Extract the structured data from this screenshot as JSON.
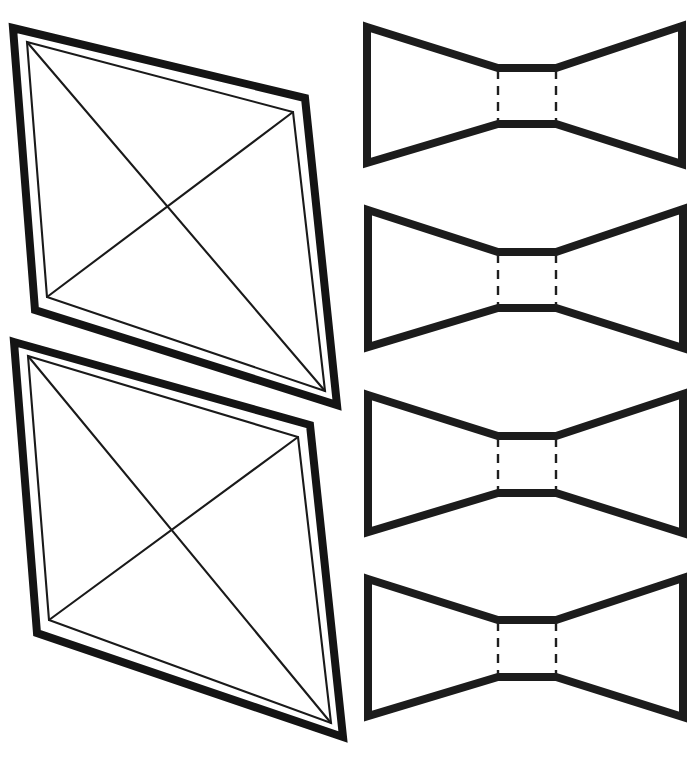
{
  "page": {
    "background_color": "#ffffff",
    "ink_color": "#141414",
    "width": 700,
    "height": 757
  },
  "style": {
    "thick_stroke_width": 8,
    "thin_stroke_width": 2.1,
    "dash_stroke_width": 2.4,
    "dash_pattern": "9 7"
  },
  "shapes": {
    "kites": [
      {
        "name": "kite-upper",
        "outer_points": "13,28 305,98 337,405 35,310",
        "inner_points": "27,42 293,112 325,391 47,297",
        "diagonals": [
          {
            "name": "diagonal-top-left-to-bottom-right",
            "x1": 27,
            "y1": 42,
            "x2": 325,
            "y2": 391
          },
          {
            "name": "diagonal-top-right-to-bottom-left",
            "x1": 293,
            "y1": 112,
            "x2": 47,
            "y2": 297
          }
        ]
      },
      {
        "name": "kite-lower",
        "outer_points": "14,342 310,425 343,737 37,633",
        "inner_points": "28,356 298,437 331,723 49,620",
        "diagonals": [
          {
            "name": "diagonal-top-left-to-bottom-right",
            "x1": 28,
            "y1": 356,
            "x2": 331,
            "y2": 723
          },
          {
            "name": "diagonal-top-right-to-bottom-left",
            "x1": 298,
            "y1": 437,
            "x2": 49,
            "y2": 620
          }
        ]
      }
    ],
    "bowties": [
      {
        "name": "bowtie-1",
        "points": "367,27 498,68 556,68 682,26 682,164 556,124 498,124 367,163",
        "fold_lines": [
          {
            "name": "fold-line-left",
            "x": 498,
            "y1": 70,
            "y2": 122
          },
          {
            "name": "fold-line-right",
            "x": 556,
            "y1": 70,
            "y2": 122
          }
        ]
      },
      {
        "name": "bowtie-2",
        "points": "368,210 498,252 556,252 683,209 683,348 556,308 498,308 368,347",
        "fold_lines": [
          {
            "name": "fold-line-left",
            "x": 498,
            "y1": 254,
            "y2": 306
          },
          {
            "name": "fold-line-right",
            "x": 556,
            "y1": 254,
            "y2": 306
          }
        ]
      },
      {
        "name": "bowtie-3",
        "points": "368,395 498,436 556,436 683,394 683,533 556,493 498,493 368,532",
        "fold_lines": [
          {
            "name": "fold-line-left",
            "x": 498,
            "y1": 438,
            "y2": 490
          },
          {
            "name": "fold-line-right",
            "x": 556,
            "y1": 438,
            "y2": 490
          }
        ]
      },
      {
        "name": "bowtie-4",
        "points": "368,579 498,620 556,620 683,578 683,717 556,677 498,677 368,716",
        "fold_lines": [
          {
            "name": "fold-line-left",
            "x": 498,
            "y1": 622,
            "y2": 674
          },
          {
            "name": "fold-line-right",
            "x": 556,
            "y1": 622,
            "y2": 674
          }
        ]
      }
    ]
  }
}
